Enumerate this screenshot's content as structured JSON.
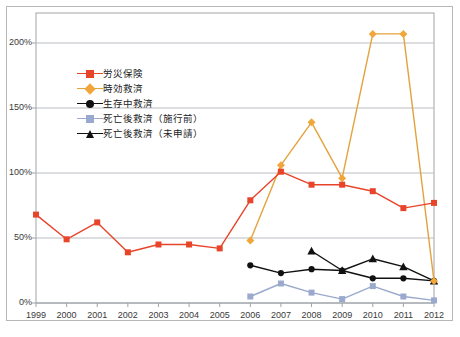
{
  "chart_data": {
    "type": "line",
    "title": "",
    "subtitle": "",
    "xlabel": "",
    "ylabel": "",
    "grid": true,
    "legend_position": "inside-upper-left",
    "categories": [
      "1999",
      "2000",
      "2001",
      "2002",
      "2003",
      "2004",
      "2005",
      "2006",
      "2007",
      "2008",
      "2009",
      "2010",
      "2011",
      "2012"
    ],
    "x": [
      1999,
      2000,
      2001,
      2002,
      2003,
      2004,
      2005,
      2006,
      2007,
      2008,
      2009,
      2010,
      2011,
      2012
    ],
    "ylim": [
      0,
      220
    ],
    "yticks": [
      0,
      50,
      100,
      150,
      200
    ],
    "ytick_labels": [
      "0%",
      "50%",
      "100%",
      "150%",
      "200%"
    ],
    "xtick_labels": [
      "1999",
      "2000",
      "2001",
      "2002",
      "2003",
      "2004",
      "2005",
      "2006",
      "2007",
      "2008",
      "2009",
      "2010",
      "2011",
      "2012"
    ],
    "series": [
      {
        "name": "労災保険",
        "color": "#e8442a",
        "marker": "square",
        "marker_color": "#e8442a",
        "values": [
          68,
          49,
          62,
          39,
          45,
          45,
          42,
          79,
          101,
          91,
          91,
          86,
          73,
          77
        ]
      },
      {
        "name": "時効救済",
        "color": "#e3a33c",
        "marker": "diamond",
        "marker_color": "#f0a63a",
        "values": [
          null,
          null,
          null,
          null,
          null,
          null,
          null,
          48,
          106,
          139,
          96,
          207,
          207,
          17
        ]
      },
      {
        "name": "生存中救済",
        "color": "#111111",
        "marker": "circle",
        "marker_color": "#111111",
        "values": [
          null,
          null,
          null,
          null,
          null,
          null,
          null,
          29,
          23,
          26,
          25,
          19,
          19,
          17
        ]
      },
      {
        "name": "死亡後救済（施行前）",
        "color": "#9aa9cd",
        "marker": "square",
        "marker_color": "#9aa9cd",
        "values": [
          null,
          null,
          null,
          null,
          null,
          null,
          null,
          5,
          15,
          8,
          3,
          13,
          5,
          2
        ]
      },
      {
        "name": "死亡後救済（未申請）",
        "color": "#111111",
        "marker": "triangle",
        "marker_color": "#111111",
        "values": [
          null,
          null,
          null,
          null,
          null,
          null,
          null,
          null,
          null,
          40,
          25,
          34,
          28,
          17
        ]
      }
    ]
  },
  "legend": {
    "items": [
      {
        "label": "労災保険"
      },
      {
        "label": "時効救済"
      },
      {
        "label": "生存中救済"
      },
      {
        "label": "死亡後救済（施行前）"
      },
      {
        "label": "死亡後救済（未申請）"
      }
    ]
  },
  "footnote": {
    "text": ""
  }
}
